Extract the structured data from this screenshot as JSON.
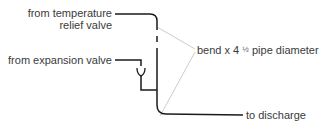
{
  "diagram": {
    "type": "pipe-discharge-schematic",
    "labels": {
      "temp_relief_line1": "from temperature",
      "temp_relief_line2": "relief valve",
      "expansion_valve": "from expansion valve",
      "bend_prefix": "bend x 4",
      "bend_fraction": "½",
      "bend_suffix": "pipe diameter",
      "discharge": "to discharge"
    },
    "colors": {
      "pipe": "#1a1a1a",
      "leader": "#c8c8c8",
      "text": "#3a3a3a",
      "background": "#ffffff"
    }
  }
}
